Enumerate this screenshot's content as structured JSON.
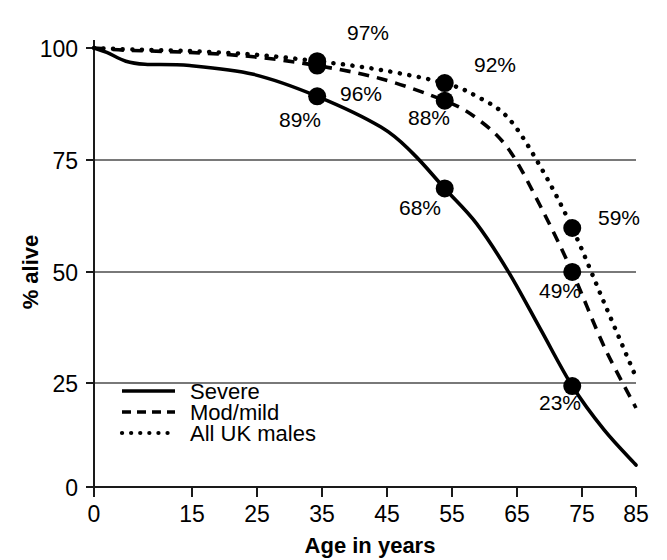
{
  "chart_data": {
    "type": "line",
    "title": "",
    "xlabel": "Age in years",
    "ylabel": "% alive",
    "xlim": [
      0,
      85
    ],
    "ylim": [
      0,
      100
    ],
    "grid": "horizontal-at-y-ticks-25-50-75",
    "legend_position": "bottom-left-inside",
    "x_ticks": [
      "0",
      "15",
      "25",
      "35",
      "45",
      "55",
      "65",
      "75",
      "85"
    ],
    "y_ticks": [
      "0",
      "25",
      "50",
      "75",
      "100"
    ],
    "series": [
      {
        "name": "Severe",
        "style": "solid",
        "x": [
          0,
          2,
          5,
          8,
          15,
          25,
          35,
          45,
          50,
          55,
          60,
          65,
          70,
          75,
          80,
          85
        ],
        "values": [
          100,
          99,
          97,
          96.3,
          96,
          94,
          89,
          82,
          76,
          68,
          60,
          49,
          36,
          23,
          13,
          5
        ],
        "labeled_points": [
          {
            "x": 35,
            "y": 89,
            "label": "89%"
          },
          {
            "x": 55,
            "y": 68,
            "label": "68%"
          },
          {
            "x": 75,
            "y": 23,
            "label": "23%"
          }
        ]
      },
      {
        "name": "Mod/mild",
        "style": "dashed",
        "x": [
          0,
          5,
          15,
          25,
          35,
          45,
          55,
          60,
          65,
          70,
          75,
          80,
          85
        ],
        "values": [
          100,
          99.5,
          99,
          98,
          96,
          93,
          88,
          84,
          77,
          64,
          49,
          32,
          18
        ],
        "labeled_points": [
          {
            "x": 35,
            "y": 96,
            "label": "96%"
          },
          {
            "x": 55,
            "y": 88,
            "label": "88%"
          },
          {
            "x": 75,
            "y": 49,
            "label": "49%"
          }
        ]
      },
      {
        "name": "All UK males",
        "style": "dotted",
        "x": [
          0,
          5,
          15,
          25,
          35,
          45,
          55,
          60,
          65,
          70,
          75,
          80,
          85
        ],
        "values": [
          100,
          99.7,
          99.3,
          98.5,
          97,
          95,
          92,
          89,
          84,
          73,
          59,
          42,
          25
        ],
        "labeled_points": [
          {
            "x": 35,
            "y": 97,
            "label": "97%"
          },
          {
            "x": 55,
            "y": 92,
            "label": "92%"
          },
          {
            "x": 75,
            "y": 59,
            "label": "59%"
          }
        ]
      }
    ],
    "annotations": [
      {
        "label": "97%",
        "series": "All UK males",
        "age": 35,
        "value": 97
      },
      {
        "label": "96%",
        "series": "Mod/mild",
        "age": 35,
        "value": 96
      },
      {
        "label": "89%",
        "series": "Severe",
        "age": 35,
        "value": 89
      },
      {
        "label": "92%",
        "series": "All UK males",
        "age": 55,
        "value": 92
      },
      {
        "label": "88%",
        "series": "Mod/mild",
        "age": 55,
        "value": 88
      },
      {
        "label": "68%",
        "series": "Severe",
        "age": 55,
        "value": 68
      },
      {
        "label": "59%",
        "series": "All UK males",
        "age": 75,
        "value": 59
      },
      {
        "label": "49%",
        "series": "Mod/mild",
        "age": 75,
        "value": 49
      },
      {
        "label": "23%",
        "series": "Severe",
        "age": 75,
        "value": 23
      }
    ],
    "colors": {
      "line": "#000000",
      "grid": "#4d4d4d",
      "axis": "#000000",
      "background": "#ffffff",
      "marker": "#000000"
    }
  },
  "axes": {
    "y_title": "% alive",
    "x_title": "Age in years",
    "y_tick_labels": [
      "100",
      "75",
      "50",
      "25",
      "0"
    ],
    "x_tick_labels": [
      "0",
      "15",
      "25",
      "35",
      "45",
      "55",
      "65",
      "75",
      "85"
    ]
  },
  "legend": {
    "items": [
      {
        "label": "Severe",
        "style": "solid"
      },
      {
        "label": "Mod/mild",
        "style": "dashed"
      },
      {
        "label": "All UK males",
        "style": "dotted"
      }
    ]
  },
  "labels": {
    "p97": "97%",
    "p96": "96%",
    "p89": "89%",
    "p92": "92%",
    "p88": "88%",
    "p68": "68%",
    "p59": "59%",
    "p49": "49%",
    "p23": "23%"
  }
}
